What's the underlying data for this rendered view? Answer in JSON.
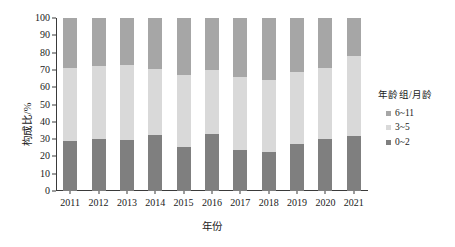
{
  "chart_data": {
    "type": "bar",
    "stacked": true,
    "title": "",
    "xlabel": "年份",
    "ylabel": "构成比/%",
    "ylim": [
      0,
      100
    ],
    "yticks": [
      0,
      10,
      20,
      30,
      40,
      50,
      60,
      70,
      80,
      90,
      100
    ],
    "grid": false,
    "legend": {
      "title": "年龄组/月龄",
      "position": "right"
    },
    "categories": [
      "2011",
      "2012",
      "2013",
      "2014",
      "2015",
      "2016",
      "2017",
      "2018",
      "2019",
      "2020",
      "2021"
    ],
    "series": [
      {
        "name": "0~2",
        "color": "#7f7f7f",
        "values": [
          29.0,
          30.0,
          29.5,
          32.5,
          25.5,
          33.0,
          23.5,
          22.5,
          27.0,
          30.0,
          32.0
        ]
      },
      {
        "name": "3~5",
        "color": "#d9d9d9",
        "values": [
          42.0,
          42.0,
          43.5,
          38.0,
          41.5,
          37.0,
          42.5,
          41.5,
          42.0,
          41.0,
          46.0
        ]
      },
      {
        "name": "6~11",
        "color": "#a6a6a6",
        "values": [
          29.0,
          28.0,
          27.0,
          29.5,
          33.0,
          30.0,
          34.0,
          36.0,
          31.0,
          29.0,
          22.0
        ]
      }
    ],
    "cumulative_tops": {
      "0~2": [
        29.0,
        30.0,
        29.5,
        32.5,
        25.5,
        33.0,
        23.5,
        22.5,
        27.0,
        30.0,
        32.0
      ],
      "3~5": [
        71.0,
        72.0,
        73.0,
        70.5,
        67.0,
        70.0,
        66.0,
        64.0,
        69.0,
        71.0,
        78.0
      ],
      "6~11": [
        100,
        100,
        100,
        100,
        100,
        100,
        100,
        100,
        100,
        100,
        100
      ]
    },
    "colors": {
      "axis": "#3a3a3a",
      "text": "#1a1a1a",
      "background": "#ffffff"
    }
  }
}
